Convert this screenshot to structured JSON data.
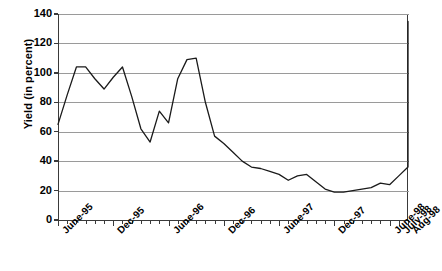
{
  "chart_data": {
    "type": "line",
    "title": "",
    "xlabel": "",
    "ylabel": "Yield (in percent)",
    "ylim": [
      0,
      140
    ],
    "ytick_values": [
      0,
      20,
      40,
      60,
      80,
      100,
      120,
      140
    ],
    "ytick_labels": [
      "0",
      "20",
      "40",
      "60",
      "80",
      "100",
      "120",
      "140"
    ],
    "grid": true,
    "legend": "none",
    "x": [
      "June-95",
      "July-95",
      "Aug-95",
      "Sept-95",
      "Oct-95",
      "Nov-95",
      "Dec-95",
      "Jan-96",
      "Feb-96",
      "Mar-96",
      "Apr-96",
      "May-96",
      "June-96",
      "July-96",
      "Aug-96",
      "Sept-96",
      "Oct-96",
      "Nov-96",
      "Dec-96",
      "Jan-97",
      "Feb-97",
      "Mar-97",
      "Apr-97",
      "May-97",
      "June-97",
      "July-97",
      "Aug-97",
      "Sept-97",
      "Oct-97",
      "Nov-97",
      "Dec-97",
      "Jan-98",
      "Feb-98",
      "Mar-98",
      "Apr-98",
      "May-98",
      "June-98",
      "July-98",
      "Aug-98"
    ],
    "xtick_labels": [
      "June-95",
      "Dec-95",
      "June-96",
      "Dec-96",
      "June-97",
      "Dec-97",
      "June-98",
      "July-98",
      "Aug-98"
    ],
    "xtick_label_indices": [
      0,
      6,
      12,
      18,
      24,
      30,
      36,
      37,
      38
    ],
    "values": [
      65,
      85,
      104,
      104,
      96,
      89,
      97,
      104,
      84,
      62,
      53,
      74,
      66,
      96,
      109,
      110,
      80,
      57,
      52,
      46,
      40,
      36,
      35,
      33,
      31,
      27,
      30,
      31,
      26,
      21,
      19,
      19,
      20,
      21,
      22,
      25,
      24,
      30,
      36
    ],
    "series_values_detailed": [
      65,
      85,
      104,
      104,
      96,
      89,
      97,
      104,
      84,
      62,
      53,
      74,
      66,
      96,
      109,
      110,
      80,
      57,
      52,
      46,
      40,
      36,
      35,
      33,
      31,
      27,
      30,
      31,
      26,
      21,
      19,
      19,
      20,
      21,
      22,
      25,
      24,
      30,
      36
    ]
  },
  "axis": {
    "y_title": "Yield (in percent)"
  }
}
